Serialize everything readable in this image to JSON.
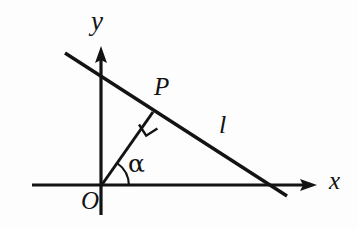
{
  "figure": {
    "kind": "geometry-diagram",
    "background_color": "#fdfdfd",
    "stroke_color": "#131313",
    "labels": {
      "y_axis": "y",
      "x_axis": "x",
      "origin": "O",
      "point_p": "P",
      "line_l": "l",
      "angle": "α"
    },
    "geometry": {
      "origin": {
        "x": 101,
        "y": 186
      },
      "x_axis": {
        "x1": 32,
        "y1": 185,
        "x2": 317,
        "y2": 185,
        "arrow_at": "right"
      },
      "y_axis": {
        "x1": 101,
        "y1": 215,
        "x2": 101,
        "y2": 48,
        "arrow_at": "top"
      },
      "line_l": {
        "x1": 65,
        "y1": 53,
        "x2": 287,
        "y2": 196
      },
      "perpendicular_foot_P": {
        "x": 152,
        "y": 113
      },
      "segment_OP": {
        "x1": 101,
        "y1": 186,
        "x2": 152,
        "y2": 113
      },
      "right_angle_mark": {
        "at_point": "P",
        "size": 13
      },
      "angle_arc": {
        "vertex": "O",
        "radius": 28,
        "from_deg": 0,
        "to_deg": 55
      },
      "line_l_crosses_x_axis_at": {
        "x": 268,
        "y": 185
      }
    },
    "stroke_widths": {
      "axis": 3.2,
      "line_l": 3.4,
      "segment": 3.0,
      "arc": 2.0,
      "right_angle": 2.2
    }
  }
}
